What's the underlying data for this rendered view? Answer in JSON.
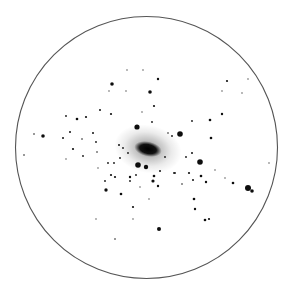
{
  "image": {
    "description": "Inverted (negative) astronomical image of a galaxy/star cluster field inside a circular field-of-view outline",
    "background": "#ffffff",
    "outline_color": "#555555",
    "circle": {
      "cx": 146.5,
      "cy": 147.5,
      "r": 131
    },
    "core": {
      "cx": 148,
      "cy": 149,
      "rx": 14,
      "ry": 7.5,
      "angle": 12,
      "halo_rx": 34,
      "halo_ry": 24
    }
  },
  "stars": [
    {
      "x": 137,
      "y": 127,
      "r": 2.6
    },
    {
      "x": 180,
      "y": 134,
      "r": 2.8
    },
    {
      "x": 200,
      "y": 162,
      "r": 2.8
    },
    {
      "x": 138,
      "y": 165,
      "r": 2.8
    },
    {
      "x": 146,
      "y": 167,
      "r": 2.2
    },
    {
      "x": 248,
      "y": 188,
      "r": 3
    },
    {
      "x": 252,
      "y": 191,
      "r": 1.8
    },
    {
      "x": 159,
      "y": 229,
      "r": 2
    },
    {
      "x": 112,
      "y": 84,
      "r": 1.8
    },
    {
      "x": 150,
      "y": 92,
      "r": 1.8
    },
    {
      "x": 43,
      "y": 136,
      "r": 1.8
    },
    {
      "x": 106,
      "y": 190,
      "r": 1.7
    },
    {
      "x": 153,
      "y": 181,
      "r": 1.6
    },
    {
      "x": 154,
      "y": 176,
      "r": 1.3
    },
    {
      "x": 158,
      "y": 79,
      "r": 1.2
    },
    {
      "x": 154,
      "y": 106,
      "r": 1.1
    },
    {
      "x": 100,
      "y": 110,
      "r": 1
    },
    {
      "x": 111,
      "y": 114,
      "r": 1.1
    },
    {
      "x": 66,
      "y": 116,
      "r": 0.9
    },
    {
      "x": 77,
      "y": 119,
      "r": 1.3
    },
    {
      "x": 86,
      "y": 117,
      "r": 1.1
    },
    {
      "x": 70,
      "y": 132,
      "r": 1
    },
    {
      "x": 34,
      "y": 134,
      "r": 0.8
    },
    {
      "x": 63,
      "y": 138,
      "r": 1
    },
    {
      "x": 93,
      "y": 133,
      "r": 1
    },
    {
      "x": 82,
      "y": 139,
      "r": 0.8
    },
    {
      "x": 73,
      "y": 149,
      "r": 1.1
    },
    {
      "x": 96,
      "y": 142,
      "r": 0.9
    },
    {
      "x": 24,
      "y": 155,
      "r": 0.8
    },
    {
      "x": 83,
      "y": 156,
      "r": 0.9
    },
    {
      "x": 97,
      "y": 152,
      "r": 0.8
    },
    {
      "x": 227,
      "y": 81,
      "r": 1.1
    },
    {
      "x": 222,
      "y": 114,
      "r": 1.2
    },
    {
      "x": 210,
      "y": 120,
      "r": 1.3
    },
    {
      "x": 192,
      "y": 121,
      "r": 0.9
    },
    {
      "x": 211,
      "y": 138,
      "r": 1.3
    },
    {
      "x": 192,
      "y": 153,
      "r": 1
    },
    {
      "x": 186,
      "y": 157,
      "r": 0.9
    },
    {
      "x": 152,
      "y": 122,
      "r": 0.9
    },
    {
      "x": 172,
      "y": 136,
      "r": 0.9
    },
    {
      "x": 168,
      "y": 133,
      "r": 0.8
    },
    {
      "x": 108,
      "y": 163,
      "r": 0.9
    },
    {
      "x": 114,
      "y": 163,
      "r": 0.9
    },
    {
      "x": 111,
      "y": 175,
      "r": 1.1
    },
    {
      "x": 115,
      "y": 177,
      "r": 1.1
    },
    {
      "x": 105,
      "y": 181,
      "r": 0.9
    },
    {
      "x": 121,
      "y": 194,
      "r": 1.3
    },
    {
      "x": 130,
      "y": 177,
      "r": 1.2
    },
    {
      "x": 130,
      "y": 181,
      "r": 0.9
    },
    {
      "x": 136,
      "y": 175,
      "r": 0.9
    },
    {
      "x": 133,
      "y": 207,
      "r": 1.1
    },
    {
      "x": 115,
      "y": 239,
      "r": 0.8
    },
    {
      "x": 160,
      "y": 171,
      "r": 1
    },
    {
      "x": 174,
      "y": 173,
      "r": 0.9
    },
    {
      "x": 189,
      "y": 173,
      "r": 1.1
    },
    {
      "x": 201,
      "y": 176,
      "r": 1.3
    },
    {
      "x": 193,
      "y": 180,
      "r": 1
    },
    {
      "x": 206,
      "y": 182,
      "r": 1.2
    },
    {
      "x": 182,
      "y": 184,
      "r": 0.8
    },
    {
      "x": 158,
      "y": 186,
      "r": 1.2
    },
    {
      "x": 233,
      "y": 183,
      "r": 1.3
    },
    {
      "x": 194,
      "y": 199,
      "r": 1.3
    },
    {
      "x": 195,
      "y": 209,
      "r": 1.2
    },
    {
      "x": 205,
      "y": 220,
      "r": 1.3
    },
    {
      "x": 209,
      "y": 219,
      "r": 1.1
    },
    {
      "x": 119,
      "y": 145,
      "r": 1
    },
    {
      "x": 123,
      "y": 148,
      "r": 0.9
    },
    {
      "x": 128,
      "y": 153,
      "r": 0.9
    },
    {
      "x": 120,
      "y": 158,
      "r": 0.9
    },
    {
      "x": 165,
      "y": 157,
      "r": 0.9
    },
    {
      "x": 175,
      "y": 173,
      "r": 0.9
    }
  ],
  "faint_stars": [
    {
      "x": 109,
      "y": 91
    },
    {
      "x": 126,
      "y": 91
    },
    {
      "x": 127,
      "y": 70
    },
    {
      "x": 143,
      "y": 70
    },
    {
      "x": 142,
      "y": 112
    },
    {
      "x": 248,
      "y": 79
    },
    {
      "x": 222,
      "y": 91
    },
    {
      "x": 242,
      "y": 93
    },
    {
      "x": 269,
      "y": 163
    },
    {
      "x": 66,
      "y": 159
    },
    {
      "x": 96,
      "y": 219
    },
    {
      "x": 133,
      "y": 219
    },
    {
      "x": 98,
      "y": 168
    },
    {
      "x": 140,
      "y": 187
    },
    {
      "x": 225,
      "y": 178
    },
    {
      "x": 215,
      "y": 170
    },
    {
      "x": 149,
      "y": 199
    }
  ]
}
